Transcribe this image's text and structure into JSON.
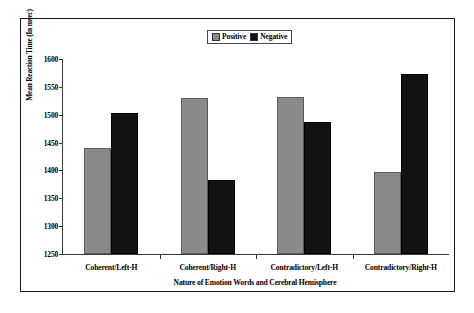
{
  "chart_data": {
    "type": "bar",
    "title": "",
    "xlabel": "Nature of Emotion Words and Cerebral Hemisphere",
    "ylabel": "Mean Reaction Time (In msec)",
    "categories": [
      "Coherent/Left-H",
      "Coherent/Right-H",
      "Contradictory/Left-H",
      "Contradictory/Right-H"
    ],
    "series": [
      {
        "name": "Positive",
        "color": "#8a8a8a",
        "values": [
          1441,
          1530,
          1531,
          1397
        ]
      },
      {
        "name": "Negative",
        "color": "#121212",
        "values": [
          1504,
          1383,
          1487,
          1573
        ]
      }
    ],
    "ylim": [
      1250,
      1600
    ],
    "yticks": [
      1250,
      1300,
      1350,
      1400,
      1450,
      1500,
      1550,
      1600
    ],
    "ytick_labels": [
      "1250",
      "1300",
      "1350",
      "1400",
      "1450",
      "1500",
      "1550",
      "1600"
    ],
    "grid": false,
    "legend_position": "top-center"
  },
  "legend": {
    "items": [
      {
        "label": "Positive",
        "swatch": "#8a8a8a",
        "icon": "legend-square-icon"
      },
      {
        "label": "Negative",
        "swatch": "#121212",
        "icon": "legend-square-icon"
      }
    ]
  },
  "colors": {
    "positive": "#8a8a8a",
    "negative": "#121212",
    "axis": "#3a3a3a",
    "frame": "#1b1b1b",
    "background": "#ffffff"
  }
}
